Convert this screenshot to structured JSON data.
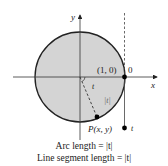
{
  "figure": {
    "labels": {
      "y_axis": "y",
      "x_axis": "x",
      "point_10": "(1, 0)",
      "origin_tangent": "0",
      "angle": "t",
      "arc": "|t|",
      "point_P": "P(x, y)",
      "point_t": "t"
    },
    "colors": {
      "disk_fill": "#d4d4d4",
      "stroke": "#222222"
    }
  },
  "caption": {
    "line1": "Arc length = |t|",
    "line2": "Line segment length = |t|"
  }
}
